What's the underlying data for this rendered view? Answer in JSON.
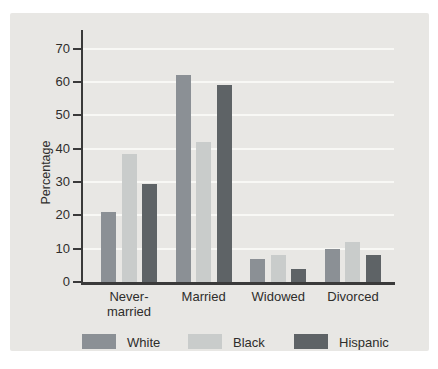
{
  "chart_data": {
    "type": "bar",
    "title": "",
    "xlabel": "",
    "ylabel": "Percentage",
    "ylim": [
      0,
      75
    ],
    "yticks": [
      0,
      10,
      20,
      30,
      40,
      50,
      60,
      70
    ],
    "grid": "horizontal white gridlines at each 10, legend bottom",
    "legend_position": "bottom",
    "categories": [
      "Never-\nmarried",
      "Married",
      "Widowed",
      "Divorced"
    ],
    "series": [
      {
        "name": "White",
        "color": "#8b9095",
        "values": [
          21,
          62,
          7,
          10
        ]
      },
      {
        "name": "Black",
        "color": "#c9cccb",
        "values": [
          38.5,
          42,
          8,
          12
        ]
      },
      {
        "name": "Hispanic",
        "color": "#5e6366",
        "values": [
          29.5,
          59,
          4,
          8
        ]
      }
    ]
  },
  "colors": {
    "page_bg": "#ffffff",
    "panel_bg": "#e8e7e4",
    "gridline": "#f8f8f5",
    "axis": "#3a3a3a",
    "text": "#2e2d2b"
  }
}
